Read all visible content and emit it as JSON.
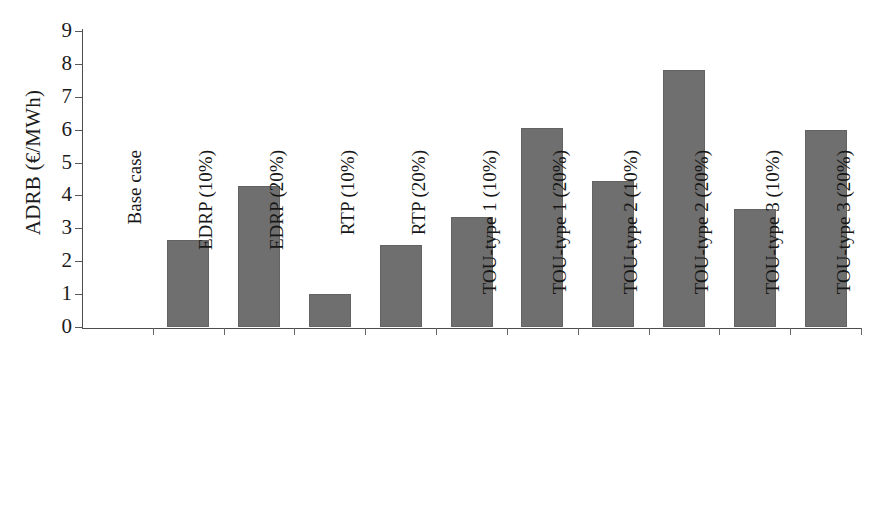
{
  "chart_data": {
    "type": "bar",
    "title": "",
    "xlabel": "",
    "ylabel": "ADRB (€/MWh)",
    "ylim": [
      0,
      9
    ],
    "yticks": [
      0,
      1,
      2,
      3,
      4,
      5,
      6,
      7,
      8,
      9
    ],
    "ytick_labels": [
      "0",
      "1",
      "2",
      "3",
      "4",
      "5",
      "6",
      "7",
      "8",
      "9"
    ],
    "grid": false,
    "legend": null,
    "bar_color": "#6f6f6f",
    "axis_color": "#4d4d4d",
    "categories": [
      "Base case",
      "EDRP (10%)",
      "EDRP (20%)",
      "RTP (10%)",
      "RTP (20%)",
      "TOU-type 1 (10%)",
      "TOU-type 1 (20%)",
      "TOU-type 2 (10%)",
      "TOU-type 2 (20%)",
      "TOU-type 3 (10%)",
      "TOU-type 3 (20%)"
    ],
    "values": [
      0,
      2.65,
      4.3,
      1.0,
      2.5,
      3.35,
      6.05,
      4.45,
      7.8,
      3.6,
      6.0
    ]
  }
}
